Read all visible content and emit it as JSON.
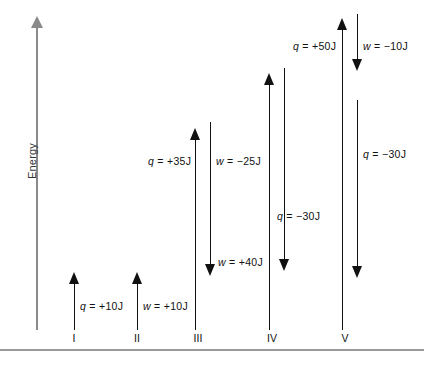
{
  "figure": {
    "axis": {
      "label": "Energy",
      "icon": "up-arrow-axis"
    },
    "processes": [
      {
        "id": "I",
        "roman": "I",
        "labels": [
          {
            "text": "q = +10J",
            "symbol": "q",
            "value": "= +10J"
          }
        ]
      },
      {
        "id": "II",
        "roman": "II",
        "labels": [
          {
            "text": "w = +10J",
            "symbol": "w",
            "value": "= +10J"
          }
        ]
      },
      {
        "id": "III",
        "roman": "III",
        "labels": [
          {
            "text": "q = +35J",
            "symbol": "q",
            "value": "= +35J"
          },
          {
            "text": "w = -25J",
            "symbol": "w",
            "value": "= −25J"
          },
          {
            "text": "w = +40J",
            "symbol": "w",
            "value": "= +40J"
          }
        ]
      },
      {
        "id": "IV",
        "roman": "IV",
        "labels": [
          {
            "text": "q = -30J",
            "symbol": "q",
            "value": "= −30J"
          }
        ]
      },
      {
        "id": "V",
        "roman": "V",
        "labels": [
          {
            "text": "q = +50J",
            "symbol": "q",
            "value": "= +50J"
          },
          {
            "text": "w = -10J",
            "symbol": "w",
            "value": "= −10J"
          },
          {
            "text": "q = -30J",
            "symbol": "q",
            "value": "= −30J"
          }
        ]
      }
    ],
    "labels": {
      "q_plus_10": "q",
      "q_plus_10_val": "= +10J",
      "w_plus_10": "w",
      "w_plus_10_val": "= +10J",
      "q_plus_35": "q",
      "q_plus_35_val": "= +35J",
      "w_minus_25": "w",
      "w_minus_25_val": "= −25J",
      "w_plus_40": "w",
      "w_plus_40_val": "= +40J",
      "q_minus_30_iv": "q",
      "q_minus_30_iv_val": "= −30J",
      "q_plus_50": "q",
      "q_plus_50_val": "= +50J",
      "w_minus_10": "w",
      "w_minus_10_val": "= −10J",
      "q_minus_30_v": "q",
      "q_minus_30_v_val": "= −30J"
    },
    "romans": {
      "one": "I",
      "two": "II",
      "three": "III",
      "four": "IV",
      "five": "V"
    },
    "colors": {
      "axis": "#8a8a8a",
      "arrow": "#111111",
      "rule": "#9a9a9a",
      "background": "#ffffff"
    }
  }
}
